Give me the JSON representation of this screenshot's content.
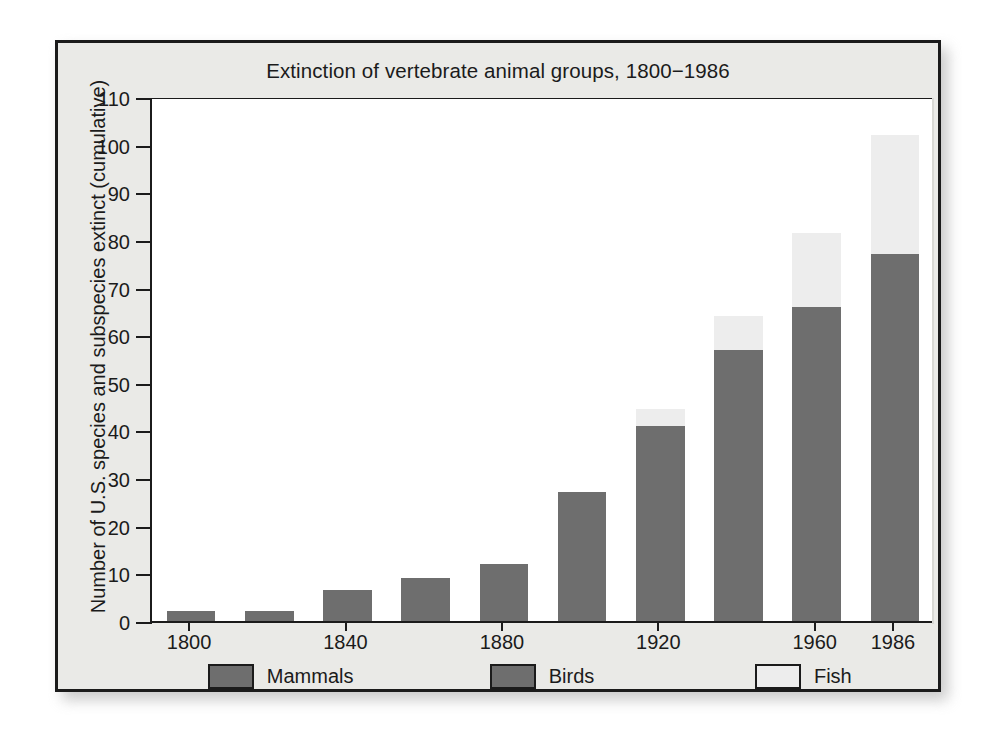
{
  "chart_data": {
    "type": "bar",
    "subtype": "stacked-bar",
    "title": "Extinction of vertebrate animal groups, 1800−1986",
    "xlabel": "",
    "ylabel": "Number of U.S. species and subspecies extinct (cumulative)",
    "ylim": [
      0,
      110
    ],
    "ytick_step": 10,
    "yticks": [
      "110",
      "100",
      "90",
      "80",
      "70",
      "60",
      "50",
      "40",
      "30",
      "20",
      "10",
      "0"
    ],
    "xticks": [
      "1800",
      "1840",
      "1880",
      "1920",
      "1960",
      "1986"
    ],
    "xtick_bar_index": [
      0,
      2,
      4,
      6,
      8,
      9
    ],
    "grid": false,
    "legend_position": "bottom",
    "categories": [
      "1800",
      "1820",
      "1840",
      "1860",
      "1880",
      "1900",
      "1920",
      "1940",
      "1960",
      "1986"
    ],
    "series": [
      {
        "name": "Mammals",
        "color": "#6e6e6e",
        "values": [
          2,
          2,
          6.5,
          9,
          12,
          27,
          41,
          57,
          66,
          77
        ]
      },
      {
        "name": "Birds",
        "color": "#6e6e6e",
        "values": [
          0,
          0,
          0,
          0,
          0,
          0,
          0,
          0,
          0,
          0
        ]
      },
      {
        "name": "Fish",
        "color": "#ededed",
        "values": [
          0,
          0,
          0,
          0,
          0,
          0,
          3.5,
          7,
          15.5,
          25
        ]
      }
    ],
    "totals": [
      2,
      2,
      6.5,
      9,
      12,
      27,
      44.5,
      64,
      81.5,
      102
    ]
  },
  "legend": {
    "items": [
      {
        "label": "Mammals",
        "color": "#6e6e6e"
      },
      {
        "label": "Birds",
        "color": "#6e6e6e"
      },
      {
        "label": "Fish",
        "color": "#ededed"
      }
    ]
  },
  "colors": {
    "panel_background": "#eaeae7",
    "plot_background": "#ffffff",
    "ink": "#1b1b1b",
    "dark_bar": "#6e6e6e",
    "light_bar": "#ededed"
  }
}
